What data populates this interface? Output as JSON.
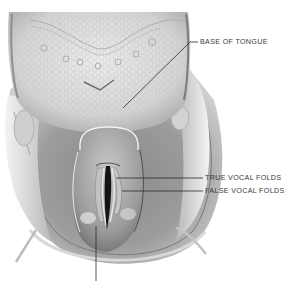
{
  "figure": {
    "colors": {
      "background": "#ffffff",
      "tissue_light": "#e2e2e2",
      "tissue_mid": "#b4b4b4",
      "tissue_dark": "#6e6e6e",
      "glottis": "#1a1a1a",
      "leader_line": "#2a2a2a",
      "label_text": "#3a3a3a"
    },
    "labels": [
      {
        "id": "base-of-tongue",
        "text": "BASE OF TONGUE",
        "x": 200,
        "y": 38,
        "line": [
          [
            123,
            108
          ],
          [
            190,
            42
          ],
          [
            198,
            42
          ]
        ]
      },
      {
        "id": "true-vocal-folds",
        "text": "TRUE VOCAL FOLDS",
        "x": 205,
        "y": 173,
        "line": [
          [
            116,
            178
          ],
          [
            203,
            178
          ]
        ]
      },
      {
        "id": "false-vocal-folds",
        "text": "FALSE VOCAL FOLDS",
        "x": 205,
        "y": 187,
        "line": [
          [
            122,
            191
          ],
          [
            203,
            191
          ]
        ]
      }
    ],
    "unlabeled_leader": {
      "line": [
        [
          96,
          226
        ],
        [
          96,
          281
        ]
      ]
    }
  }
}
